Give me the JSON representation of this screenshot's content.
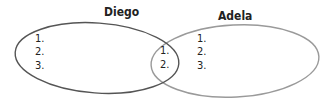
{
  "diagram": {
    "type": "venn",
    "sets": [
      {
        "name": "Diego",
        "items": [
          "1.",
          "2.",
          "3."
        ],
        "stroke": "#555555"
      },
      {
        "name": "Adela",
        "items": [
          "1.",
          "2.",
          "3."
        ],
        "stroke": "#999999"
      }
    ],
    "intersection": {
      "items": [
        "1.",
        "2."
      ]
    }
  }
}
